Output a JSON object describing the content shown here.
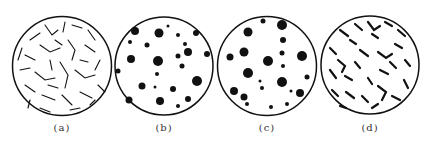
{
  "panels": [
    {
      "id": "a",
      "label": "(a)",
      "cx": 62,
      "cy": 66,
      "r": 50,
      "pattern": "filamentous-strands"
    },
    {
      "id": "b",
      "label": "(b)",
      "cx": 164,
      "cy": 66,
      "r": 49,
      "pattern": "irregular-fluffy-clusters"
    },
    {
      "id": "c",
      "label": "(c)",
      "cx": 267,
      "cy": 66,
      "r": 50,
      "pattern": "round-dense-dots"
    },
    {
      "id": "d",
      "label": "(d)",
      "cx": 370,
      "cy": 65,
      "r": 49,
      "pattern": "short-curved-segments-clustered"
    }
  ],
  "colors": {
    "ink": "#111111",
    "background": "#ffffff",
    "label": "#333333"
  }
}
